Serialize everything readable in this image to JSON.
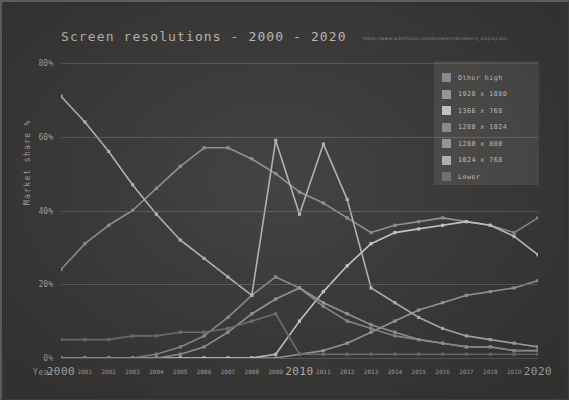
{
  "title": "Screen resolutions - 2000 - 2020",
  "source_url": "https://www.w3schools.com/browsers/browsers_display.asp",
  "axis": {
    "y_title": "Market share %",
    "x_title": "Year",
    "y_ticks": [
      "0%",
      "20%",
      "40%",
      "60%",
      "80%"
    ],
    "x_ticks": [
      "2000",
      "2001",
      "2002",
      "2003",
      "2004",
      "2005",
      "2006",
      "2007",
      "2008",
      "2009",
      "2010",
      "2011",
      "2012",
      "2013",
      "2014",
      "2015",
      "2016",
      "2017",
      "2018",
      "2019",
      "2020"
    ]
  },
  "legend": {
    "items": [
      {
        "label": "Other high",
        "color": "#8e8e8e"
      },
      {
        "label": "1920 x 1080",
        "color": "#9a9a9a"
      },
      {
        "label": "1366 x 768",
        "color": "#c4c4c4"
      },
      {
        "label": "1280 x 1024",
        "color": "#8a8a8a"
      },
      {
        "label": "1280 x 800",
        "color": "#959595"
      },
      {
        "label": "1024 x 768",
        "color": "#b0b0b0"
      },
      {
        "label": "Lower",
        "color": "#707070"
      }
    ]
  },
  "chart_data": {
    "type": "line",
    "title": "Screen resolutions - 2000 - 2020",
    "xlabel": "Year",
    "ylabel": "Market share %",
    "ylim": [
      0,
      80
    ],
    "grid": true,
    "legend_position": "top-right",
    "x": [
      "2000",
      "2001",
      "2002",
      "2003",
      "2004",
      "2005",
      "2006",
      "2007",
      "2008",
      "2009",
      "2010",
      "2011",
      "2012",
      "2013",
      "2014",
      "2015",
      "2016",
      "2017",
      "2018",
      "2019",
      "2020"
    ],
    "series": [
      {
        "name": "Other high",
        "color": "#8e8e8e",
        "values": [
          24,
          31,
          36,
          40,
          46,
          52,
          57,
          57,
          54,
          50,
          45,
          42,
          38,
          34,
          36,
          37,
          38,
          37,
          36,
          34,
          38
        ]
      },
      {
        "name": "1920 x 1080",
        "color": "#9a9a9a",
        "values": [
          0,
          0,
          0,
          0,
          0,
          0,
          0,
          0,
          0,
          0,
          1,
          2,
          4,
          7,
          10,
          13,
          15,
          17,
          18,
          19,
          21
        ]
      },
      {
        "name": "1366 x 768",
        "color": "#c4c4c4",
        "values": [
          0,
          0,
          0,
          0,
          0,
          0,
          0,
          0,
          0,
          1,
          10,
          18,
          25,
          31,
          34,
          35,
          36,
          37,
          36,
          33,
          28
        ]
      },
      {
        "name": "1280 x 1024",
        "color": "#8a8a8a",
        "values": [
          0,
          0,
          0,
          0,
          1,
          3,
          6,
          11,
          17,
          22,
          19,
          14,
          10,
          8,
          6,
          5,
          4,
          3,
          3,
          2,
          2
        ]
      },
      {
        "name": "1280 x 800",
        "color": "#959595",
        "values": [
          0,
          0,
          0,
          0,
          0,
          1,
          3,
          7,
          12,
          16,
          19,
          15,
          12,
          9,
          7,
          5,
          4,
          3,
          3,
          2,
          2
        ]
      },
      {
        "name": "1024 x 768",
        "color": "#b0b0b0",
        "values": [
          71,
          64,
          56,
          47,
          39,
          32,
          27,
          22,
          17,
          59,
          39,
          58,
          43,
          19,
          15,
          11,
          8,
          6,
          5,
          4,
          3
        ]
      },
      {
        "name": "Lower",
        "color": "#707070",
        "values": [
          5,
          5,
          5,
          6,
          6,
          7,
          7,
          8,
          10,
          12,
          1,
          1,
          1,
          1,
          1,
          1,
          1,
          1,
          1,
          1,
          1
        ]
      }
    ]
  }
}
